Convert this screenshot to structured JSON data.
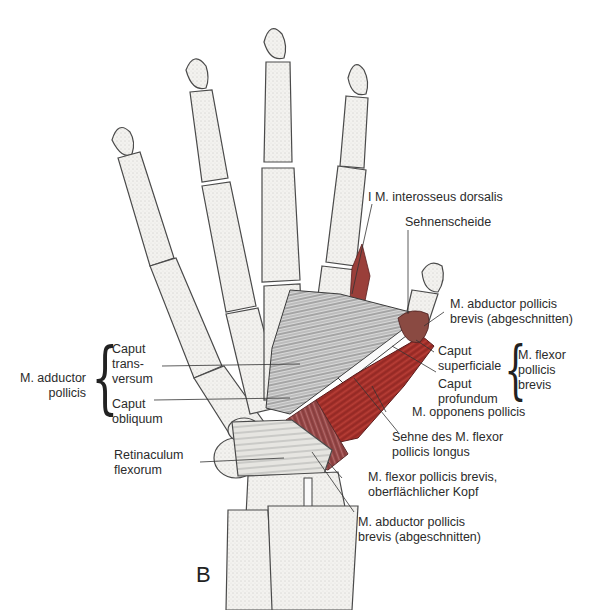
{
  "figure": {
    "panel_letter": "B",
    "colors": {
      "background": "#ffffff",
      "bone_fill": "#f2f1ee",
      "bone_stroke": "#4a4a4a",
      "muscle_red": "#a8322c",
      "muscle_dark": "#7a2a2a",
      "muscle_grey": "#6d6d6d",
      "text": "#2b2b2b"
    }
  },
  "labels": {
    "interosseus": "I M. interosseus dorsalis",
    "sehnenscheide": "Sehnenscheide",
    "abductor_top": "M. abductor pollicis\nbrevis (abgeschnitten)",
    "caput_superficiale": "Caput\nsuperficiale",
    "caput_profundum": "Caput\nprofundum",
    "flexor_brevis_group": "M. flexor\npollicis\nbrevis",
    "opponens": "M. opponens pollicis",
    "sehne_flexor_longus": "Sehne des M. flexor\npollicis longus",
    "flexor_brevis_superficial": "M. flexor pollicis brevis,\noberflächlicher Kopf",
    "abductor_bottom": "M. abductor pollicis\nbrevis (abgeschnitten)",
    "adductor_group": "M. adductor\npollicis",
    "caput_transversum": "Caput\ntrans-\nversum",
    "caput_obliquum": "Caput\nobliquum",
    "retinaculum": "Retinaculum\nflexorum"
  }
}
